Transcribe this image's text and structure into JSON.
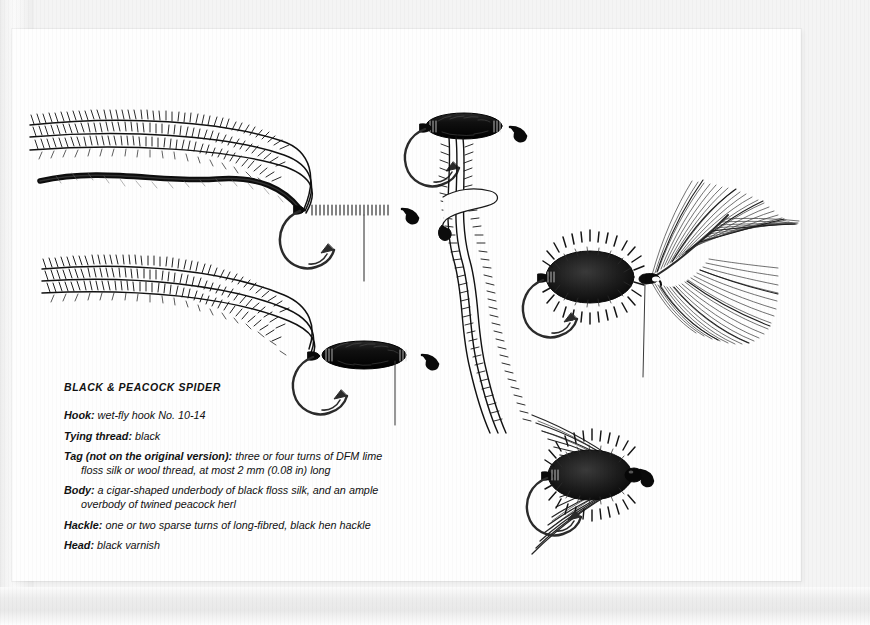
{
  "page": {
    "background_color": "#f4f4f4",
    "paper_color": "#fefefe",
    "ink_color": "#111111"
  },
  "caption": {
    "title": "BLACK & PEACOCK SPIDER",
    "entries": [
      {
        "label": "Hook:",
        "text": " wet-fly hook No. 10-14",
        "continuation": ""
      },
      {
        "label": "Tying thread:",
        "text": " black",
        "continuation": ""
      },
      {
        "label": "Tag (not on the original version):",
        "text": " three or four turns of DFM",
        "continuation": "lime floss silk or wool thread, at most 2 mm (0.08 in) long"
      },
      {
        "label": "Body:",
        "text": " a cigar-shaped underbody of black floss silk, and an",
        "continuation": "ample overbody of twined peacock herl"
      },
      {
        "label": "Hackle:",
        "text": " one or two sparse turns of long-fibred, black hen hackle",
        "continuation": ""
      },
      {
        "label": "Head:",
        "text": " black varnish",
        "continuation": ""
      }
    ]
  },
  "illustrations": [
    {
      "name": "peacock-herl-bundle-upper",
      "description": "Three long peacock herl fibres with a twisted silk strand, barbs combed to one side"
    },
    {
      "name": "peacock-herl-bundle-lower",
      "description": "Second bundle of three peacock herl fibres"
    },
    {
      "name": "hook-with-thread-base",
      "description": "Bare wet-fly hook with thread underbody wrapped along the shank and tying thread hanging"
    },
    {
      "name": "hook-with-floss-underbody",
      "description": "Hook with cigar-shaped black floss silk underbody"
    },
    {
      "name": "hook-herl-tied-in",
      "description": "Hook with twined peacock herl tied in at the head and hanging down"
    },
    {
      "name": "hook-herl-wound-body",
      "description": "Hook with the spiky peacock herl overbody wound over the underbody, black hen hackle feather tied in at the head"
    },
    {
      "name": "hen-hackle-feather",
      "description": "Black hen hackle feather with long soft fibres"
    },
    {
      "name": "finished-fly",
      "description": "Completed Black & Peacock Spider wet fly with swept-back hackle and varnished head"
    }
  ]
}
